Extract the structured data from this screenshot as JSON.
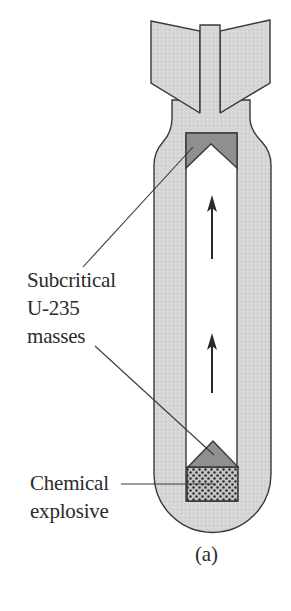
{
  "figure": {
    "type": "diagram",
    "caption": "(a)",
    "labels": {
      "subcritical_line1": "Subcritical",
      "subcritical_line2": "U-235",
      "subcritical_line3": "masses",
      "explosive_line1": "Chemical",
      "explosive_line2": "explosive"
    },
    "parts": [
      {
        "name": "tail-fins",
        "fill": "#d6d6d6"
      },
      {
        "name": "bomb-casing",
        "fill": "#d6d6d6"
      },
      {
        "name": "gun-barrel",
        "fill": "#ffffff"
      },
      {
        "name": "subcritical-mass-top",
        "fill": "#8f8f8f"
      },
      {
        "name": "subcritical-mass-bottom",
        "fill": "#8f8f8f"
      },
      {
        "name": "chemical-explosive",
        "fill": "#bdbdbd",
        "pattern": "dots"
      },
      {
        "name": "motion-arrow",
        "count": 2,
        "direction": "up"
      }
    ],
    "colors": {
      "outline": "#3a3a3a",
      "casing": "#d6d6d6",
      "mass": "#8f8f8f",
      "explosive_bg": "#c4c4c4",
      "explosive_dots": "#303030",
      "arrow": "#2a2a2a"
    }
  }
}
